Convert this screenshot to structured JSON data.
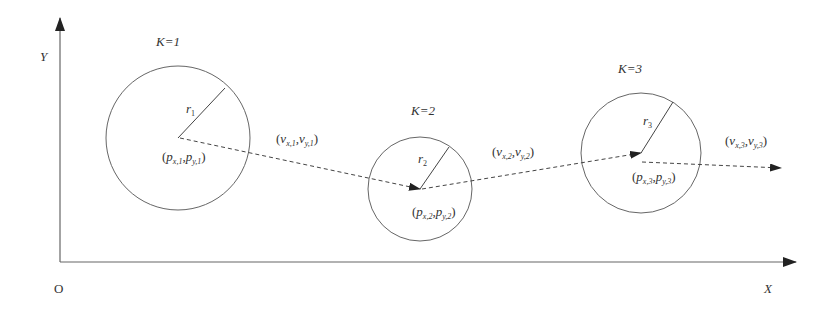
{
  "diagram": {
    "axes": {
      "origin_label": "O",
      "x_label": "X",
      "y_label": "Y"
    },
    "line_color": "#555555",
    "circles": [
      {
        "k_label": "K=1",
        "radius_label": "r",
        "radius_sub": "1",
        "position_label": {
          "p": "p",
          "x_sub": "x,1",
          "y_sub": "y,1"
        },
        "center": [
          178,
          138
        ],
        "r": 72
      },
      {
        "k_label": "K=2",
        "radius_label": "r",
        "radius_sub": "2",
        "position_label": {
          "p": "p",
          "x_sub": "x,2",
          "y_sub": "y,2"
        },
        "center": [
          420,
          189
        ],
        "r": 52
      },
      {
        "k_label": "K=3",
        "radius_label": "r",
        "radius_sub": "3",
        "position_label": {
          "p": "p",
          "x_sub": "x,3",
          "y_sub": "y,3"
        },
        "center": [
          640,
          153
        ],
        "r": 60
      }
    ],
    "velocities": [
      {
        "v": "v",
        "x_sub": "x,1",
        "y_sub": "y,1"
      },
      {
        "v": "v",
        "x_sub": "x,2",
        "y_sub": "y,2"
      },
      {
        "v": "v",
        "x_sub": "x,3",
        "y_sub": "y,3"
      }
    ]
  }
}
